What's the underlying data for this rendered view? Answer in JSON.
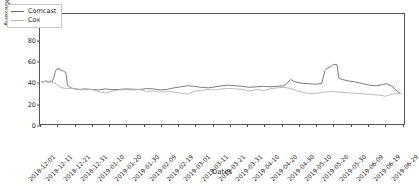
{
  "chart_data": {
    "type": "line",
    "title": "",
    "xlabel": "Dates",
    "ylabel": "Average RTT (milliseconds)",
    "ylim": [
      0,
      105
    ],
    "yticks": [
      0,
      20,
      40,
      60,
      80,
      100
    ],
    "grid": false,
    "legend_position": "upper left",
    "x_tick_rotation": -45,
    "xlim": [
      "2018-12-01",
      "2019-07-01"
    ],
    "categories": [
      "2018-12-01",
      "2018-12-11",
      "2018-12-21",
      "2018-12-31",
      "2019-01-10",
      "2019-01-20",
      "2019-01-30",
      "2019-02-09",
      "2019-02-19",
      "2019-03-01",
      "2019-03-11",
      "2019-03-21",
      "2019-03-31",
      "2019-04-10",
      "2019-04-20",
      "2019-04-30",
      "2019-05-10",
      "2019-05-20",
      "2019-05-30",
      "2019-06-09",
      "2019-06-19",
      "2019-06-29"
    ],
    "series": [
      {
        "name": "Comcast",
        "color": "#6e6e6e",
        "x": [
          "2018-12-02",
          "2018-12-03",
          "2018-12-04",
          "2018-12-05",
          "2018-12-06",
          "2018-12-07",
          "2018-12-08",
          "2018-12-09",
          "2018-12-10",
          "2018-12-11",
          "2018-12-12",
          "2018-12-13",
          "2018-12-14",
          "2018-12-15",
          "2018-12-16",
          "2018-12-17",
          "2018-12-19",
          "2018-12-21",
          "2018-12-24",
          "2018-12-27",
          "2018-12-31",
          "2019-01-04",
          "2019-01-08",
          "2019-01-12",
          "2019-01-16",
          "2019-01-20",
          "2019-01-24",
          "2019-01-28",
          "2019-02-01",
          "2019-02-05",
          "2019-02-09",
          "2019-02-13",
          "2019-02-17",
          "2019-02-21",
          "2019-02-25",
          "2019-03-01",
          "2019-03-05",
          "2019-03-09",
          "2019-03-13",
          "2019-03-17",
          "2019-03-21",
          "2019-03-25",
          "2019-03-29",
          "2019-04-02",
          "2019-04-06",
          "2019-04-10",
          "2019-04-14",
          "2019-04-18",
          "2019-04-22",
          "2019-04-24",
          "2019-04-26",
          "2019-04-28",
          "2019-05-02",
          "2019-05-06",
          "2019-05-10",
          "2019-05-14",
          "2019-05-16",
          "2019-05-17",
          "2019-05-19",
          "2019-05-21",
          "2019-05-23",
          "2019-05-24",
          "2019-05-26",
          "2019-05-30",
          "2019-06-03",
          "2019-06-07",
          "2019-06-11",
          "2019-06-15",
          "2019-06-18",
          "2019-06-21",
          "2019-06-24",
          "2019-06-27",
          "2019-06-29"
        ],
        "values": [
          40.5,
          40.0,
          41.2,
          40.8,
          39.5,
          41.0,
          40.2,
          44.0,
          50.5,
          52.5,
          53.2,
          51.0,
          51.5,
          50.0,
          49.5,
          37.0,
          34.5,
          33.5,
          33.0,
          33.5,
          33.0,
          32.5,
          33.5,
          32.8,
          33.0,
          33.5,
          33.2,
          33.0,
          33.8,
          33.5,
          32.5,
          33.0,
          34.5,
          35.5,
          36.5,
          36.0,
          35.0,
          34.5,
          35.5,
          36.5,
          37.0,
          36.5,
          36.0,
          35.0,
          35.5,
          36.0,
          35.5,
          36.0,
          36.5,
          39.5,
          42.5,
          40.5,
          39.0,
          38.5,
          38.0,
          38.5,
          51.0,
          53.0,
          54.5,
          57.0,
          56.5,
          44.0,
          42.5,
          41.0,
          40.0,
          38.5,
          37.0,
          36.5,
          37.5,
          38.5,
          36.0,
          31.5,
          29.0
        ]
      },
      {
        "name": "Cox",
        "color": "#b3b3b3",
        "x": [
          "2018-12-02",
          "2018-12-03",
          "2018-12-04",
          "2018-12-05",
          "2018-12-06",
          "2018-12-07",
          "2018-12-08",
          "2018-12-09",
          "2018-12-10",
          "2018-12-12",
          "2018-12-14",
          "2018-12-16",
          "2018-12-19",
          "2018-12-22",
          "2018-12-26",
          "2018-12-31",
          "2019-01-04",
          "2019-01-08",
          "2019-01-12",
          "2019-01-16",
          "2019-01-20",
          "2019-01-24",
          "2019-01-28",
          "2019-02-01",
          "2019-02-05",
          "2019-02-09",
          "2019-02-13",
          "2019-02-17",
          "2019-02-21",
          "2019-02-25",
          "2019-03-01",
          "2019-03-05",
          "2019-03-09",
          "2019-03-13",
          "2019-03-17",
          "2019-03-21",
          "2019-03-25",
          "2019-03-29",
          "2019-04-02",
          "2019-04-06",
          "2019-04-10",
          "2019-04-14",
          "2019-04-18",
          "2019-04-22",
          "2019-04-26",
          "2019-04-30",
          "2019-05-04",
          "2019-05-08",
          "2019-05-12",
          "2019-05-16",
          "2019-05-20",
          "2019-05-24",
          "2019-05-28",
          "2019-06-01",
          "2019-06-05",
          "2019-06-09",
          "2019-06-13",
          "2019-06-17",
          "2019-06-20",
          "2019-06-23",
          "2019-06-26",
          "2019-06-29"
        ],
        "values": [
          40.0,
          39.5,
          41.0,
          40.0,
          40.5,
          41.5,
          40.0,
          39.0,
          38.5,
          36.0,
          34.5,
          34.0,
          34.0,
          33.5,
          32.5,
          33.0,
          31.0,
          29.5,
          31.5,
          32.5,
          32.8,
          32.5,
          33.0,
          31.0,
          31.5,
          30.5,
          31.0,
          30.5,
          29.5,
          28.5,
          31.5,
          32.0,
          33.0,
          32.5,
          33.5,
          34.0,
          33.5,
          33.0,
          31.5,
          33.0,
          32.0,
          33.5,
          34.5,
          35.0,
          34.0,
          31.5,
          30.0,
          29.0,
          29.5,
          30.5,
          31.0,
          30.5,
          30.0,
          29.5,
          29.0,
          28.5,
          28.0,
          27.5,
          26.5,
          28.0,
          29.0,
          29.0
        ]
      }
    ]
  },
  "legend": {
    "entries": [
      {
        "label": "Comcast"
      },
      {
        "label": "Cox"
      }
    ]
  }
}
